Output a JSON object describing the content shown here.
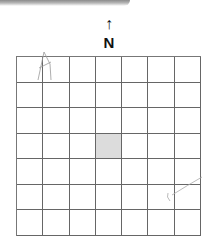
{
  "compass": {
    "arrow_symbol": "↑",
    "label": "N"
  },
  "grid": {
    "rows": 7,
    "cols": 7,
    "shaded_cells": [
      {
        "row": 4,
        "col": 4
      }
    ],
    "line_color": "#666666",
    "shade_color": "#dcdcdc"
  },
  "annotations": [
    {
      "type": "pencil-mark",
      "location": "row 1, col 2"
    },
    {
      "type": "pencil-mark",
      "location": "rows 5-6, cols 6-7"
    }
  ]
}
